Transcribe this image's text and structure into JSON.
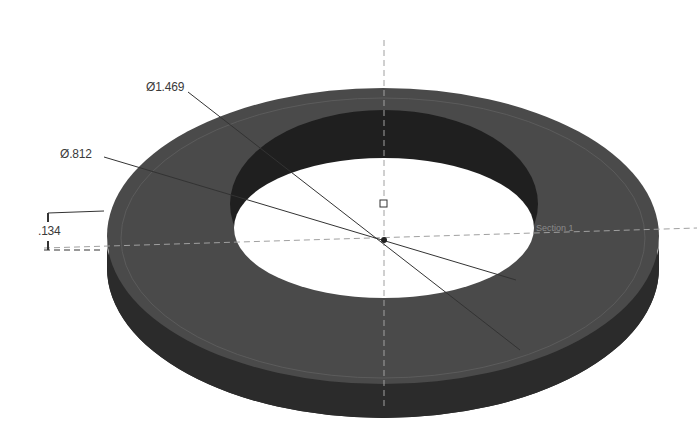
{
  "model": {
    "part": "washer",
    "view": "isometric 3D",
    "colors": {
      "top_face": "#4a4a4a",
      "side_face": "#2b2b2b",
      "inner_wall": "#222222",
      "background": "#ffffff",
      "dim_line": "#3a3a3a",
      "centerline": "#9a9a9a"
    }
  },
  "dimensions": {
    "outer_diameter": "Ø1.469",
    "inner_diameter": "Ø.812",
    "thickness": ".134"
  },
  "annotations": {
    "section_label": "Section 1"
  }
}
